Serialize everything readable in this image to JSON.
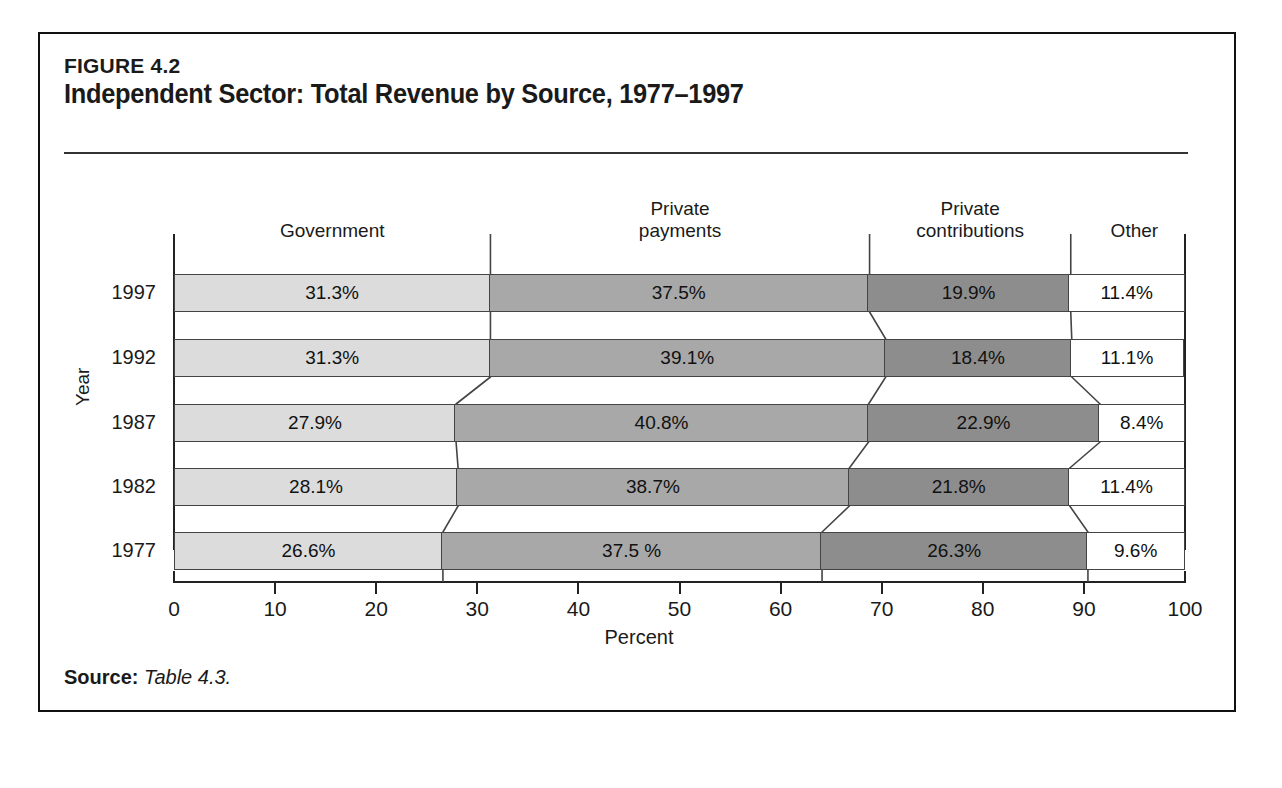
{
  "figure": {
    "label": "FIGURE 4.2",
    "title": "Independent Sector: Total Revenue by Source, 1977–1997",
    "source_prefix": "Source:",
    "source_text": "Table 4.3."
  },
  "axes": {
    "y_title": "Year",
    "x_title": "Percent",
    "x_ticks": [
      "0",
      "10",
      "20",
      "30",
      "40",
      "50",
      "60",
      "70",
      "80",
      "90",
      "100"
    ]
  },
  "headers": [
    {
      "line1": "Government",
      "line2": ""
    },
    {
      "line1": "Private",
      "line2": "payments"
    },
    {
      "line1": "Private",
      "line2": "contributions"
    },
    {
      "line1": "Other",
      "line2": ""
    }
  ],
  "colors": {
    "government": "#dcdcdc",
    "private_payments": "#a8a8a8",
    "private_contributions": "#8d8d8d",
    "other": "#ffffff",
    "outline": "#444444",
    "frame": "#111111"
  },
  "chart_data": {
    "type": "bar",
    "orientation": "horizontal",
    "stacked": true,
    "percent_stacked": true,
    "title": "Independent Sector: Total Revenue by Source, 1977–1997",
    "xlabel": "Percent",
    "ylabel": "Year",
    "xlim": [
      0,
      100
    ],
    "xticks": [
      0,
      10,
      20,
      30,
      40,
      50,
      60,
      70,
      80,
      90,
      100
    ],
    "grid": false,
    "legend": "column-headers-above-plot",
    "categories": [
      "1997",
      "1992",
      "1987",
      "1982",
      "1977"
    ],
    "series": [
      {
        "name": "Government",
        "values": [
          31.3,
          31.3,
          27.9,
          28.1,
          26.6
        ],
        "color": "#dcdcdc"
      },
      {
        "name": "Private payments",
        "values": [
          37.5,
          39.1,
          40.8,
          38.7,
          37.5
        ],
        "color": "#a8a8a8"
      },
      {
        "name": "Private contributions",
        "values": [
          19.9,
          18.4,
          22.9,
          21.8,
          26.3
        ],
        "color": "#8d8d8d"
      },
      {
        "name": "Other",
        "values": [
          11.4,
          11.1,
          8.4,
          11.4,
          9.6
        ],
        "color": "#ffffff"
      }
    ],
    "rows": [
      {
        "year": "1997",
        "cells": [
          {
            "series": "Government",
            "value": 31.3,
            "label": "31.3%"
          },
          {
            "series": "Private payments",
            "value": 37.5,
            "label": "37.5%"
          },
          {
            "series": "Private contributions",
            "value": 19.9,
            "label": "19.9%"
          },
          {
            "series": "Other",
            "value": 11.4,
            "label": "11.4%"
          }
        ]
      },
      {
        "year": "1992",
        "cells": [
          {
            "series": "Government",
            "value": 31.3,
            "label": "31.3%"
          },
          {
            "series": "Private payments",
            "value": 39.1,
            "label": "39.1%"
          },
          {
            "series": "Private contributions",
            "value": 18.4,
            "label": "18.4%"
          },
          {
            "series": "Other",
            "value": 11.1,
            "label": "11.1%"
          }
        ]
      },
      {
        "year": "1987",
        "cells": [
          {
            "series": "Government",
            "value": 27.9,
            "label": "27.9%"
          },
          {
            "series": "Private payments",
            "value": 40.8,
            "label": "40.8%"
          },
          {
            "series": "Private contributions",
            "value": 22.9,
            "label": "22.9%"
          },
          {
            "series": "Other",
            "value": 8.4,
            "label": "8.4%"
          }
        ]
      },
      {
        "year": "1982",
        "cells": [
          {
            "series": "Government",
            "value": 28.1,
            "label": "28.1%"
          },
          {
            "series": "Private payments",
            "value": 38.7,
            "label": "38.7%"
          },
          {
            "series": "Private contributions",
            "value": 21.8,
            "label": "21.8%"
          },
          {
            "series": "Other",
            "value": 11.4,
            "label": "11.4%"
          }
        ]
      },
      {
        "year": "1977",
        "cells": [
          {
            "series": "Government",
            "value": 26.6,
            "label": "26.6%"
          },
          {
            "series": "Private payments",
            "value": 37.5,
            "label": "37.5 %"
          },
          {
            "series": "Private contributions",
            "value": 26.3,
            "label": "26.3%"
          },
          {
            "series": "Other",
            "value": 9.6,
            "label": "9.6%"
          }
        ]
      }
    ]
  }
}
